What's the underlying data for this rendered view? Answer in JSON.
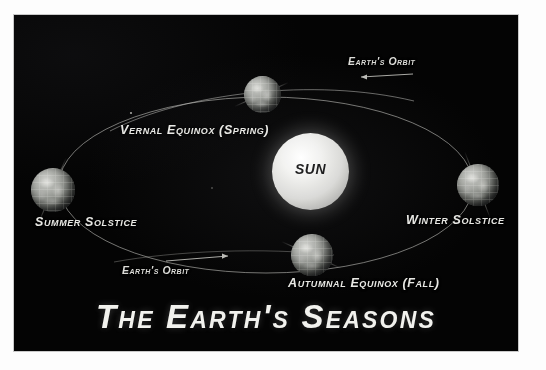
{
  "poster": {
    "title": "The Earth's Seasons",
    "background_color": "#040404",
    "border_color": "#fdfdfd",
    "label_color": "#e8e8e4"
  },
  "sun": {
    "label": "SUN",
    "color": "#f2f2f0"
  },
  "orbit": {
    "annotations": [
      {
        "id": "orbit-top",
        "label": "Earth's Orbit",
        "arrow_direction": "left"
      },
      {
        "id": "orbit-bottom",
        "label": "Earth's Orbit",
        "arrow_direction": "right"
      }
    ]
  },
  "positions": [
    {
      "id": "vernal-equinox",
      "label": "Vernal Equinox (Spring)"
    },
    {
      "id": "summer-solstice",
      "label": "Summer Solstice"
    },
    {
      "id": "autumnal-equinox",
      "label": "Autumnal Equinox (Fall)"
    },
    {
      "id": "winter-solstice",
      "label": "Winter Solstice"
    }
  ]
}
